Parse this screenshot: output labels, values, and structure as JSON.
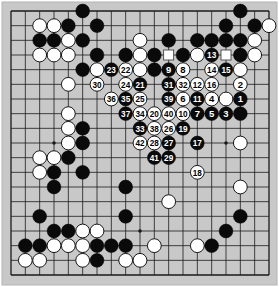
{
  "board": {
    "size": 19,
    "colors": {
      "background": "#c8c8c8",
      "line": "#1a1a1a",
      "black": "#0a0a0a",
      "white": "#ffffff",
      "border": "#b4b4b4"
    },
    "star_points": [
      [
        3,
        3
      ],
      [
        9,
        3
      ],
      [
        15,
        3
      ],
      [
        3,
        9
      ],
      [
        9,
        9
      ],
      [
        15,
        9
      ],
      [
        3,
        15
      ],
      [
        9,
        15
      ],
      [
        15,
        15
      ]
    ],
    "stones": [
      {
        "c": 5,
        "r": 0,
        "color": "B"
      },
      {
        "c": 16,
        "r": 0,
        "color": "B"
      },
      {
        "c": 2,
        "r": 1,
        "color": "W"
      },
      {
        "c": 3,
        "r": 1,
        "color": "W"
      },
      {
        "c": 4,
        "r": 1,
        "color": "B"
      },
      {
        "c": 6,
        "r": 1,
        "color": "B"
      },
      {
        "c": 15,
        "r": 1,
        "color": "B"
      },
      {
        "c": 17,
        "r": 1,
        "color": "B"
      },
      {
        "c": 18,
        "r": 1,
        "color": "W"
      },
      {
        "c": 2,
        "r": 2,
        "color": "B"
      },
      {
        "c": 3,
        "r": 2,
        "color": "B"
      },
      {
        "c": 4,
        "r": 2,
        "color": "W"
      },
      {
        "c": 5,
        "r": 2,
        "color": "B"
      },
      {
        "c": 9,
        "r": 2,
        "color": "W"
      },
      {
        "c": 11,
        "r": 2,
        "color": "B"
      },
      {
        "c": 13,
        "r": 2,
        "color": "B"
      },
      {
        "c": 14,
        "r": 2,
        "color": "B"
      },
      {
        "c": 15,
        "r": 2,
        "color": "B"
      },
      {
        "c": 16,
        "r": 2,
        "color": "B"
      },
      {
        "c": 17,
        "r": 2,
        "color": "W"
      },
      {
        "c": 2,
        "r": 3,
        "color": "W"
      },
      {
        "c": 3,
        "r": 3,
        "color": "W"
      },
      {
        "c": 4,
        "r": 3,
        "color": "W"
      },
      {
        "c": 6,
        "r": 3,
        "color": "B"
      },
      {
        "c": 8,
        "r": 3,
        "color": "B"
      },
      {
        "c": 9,
        "r": 3,
        "color": "W"
      },
      {
        "c": 10,
        "r": 3,
        "color": "B"
      },
      {
        "c": 12,
        "r": 3,
        "color": "B"
      },
      {
        "c": 13,
        "r": 3,
        "color": "W"
      },
      {
        "c": 14,
        "r": 3,
        "color": "B",
        "label": "13"
      },
      {
        "c": 16,
        "r": 3,
        "color": "B"
      },
      {
        "c": 17,
        "r": 3,
        "color": "W"
      },
      {
        "c": 5,
        "r": 4,
        "color": "B"
      },
      {
        "c": 6,
        "r": 4,
        "color": "W"
      },
      {
        "c": 7,
        "r": 4,
        "color": "B",
        "label": "23"
      },
      {
        "c": 8,
        "r": 4,
        "color": "W",
        "label": "22"
      },
      {
        "c": 9,
        "r": 4,
        "color": "W"
      },
      {
        "c": 10,
        "r": 4,
        "color": "B"
      },
      {
        "c": 11,
        "r": 4,
        "color": "B",
        "label": "9"
      },
      {
        "c": 12,
        "r": 4,
        "color": "W",
        "label": "8"
      },
      {
        "c": 14,
        "r": 4,
        "color": "W",
        "label": "14"
      },
      {
        "c": 15,
        "r": 4,
        "color": "B",
        "label": "15"
      },
      {
        "c": 16,
        "r": 4,
        "color": "W"
      },
      {
        "c": 4,
        "r": 5,
        "color": "W"
      },
      {
        "c": 6,
        "r": 5,
        "color": "W",
        "label": "30"
      },
      {
        "c": 8,
        "r": 5,
        "color": "W",
        "label": "24"
      },
      {
        "c": 9,
        "r": 5,
        "color": "B",
        "label": "21"
      },
      {
        "c": 11,
        "r": 5,
        "color": "B",
        "label": "31"
      },
      {
        "c": 12,
        "r": 5,
        "color": "W",
        "label": "32"
      },
      {
        "c": 13,
        "r": 5,
        "color": "W",
        "label": "12"
      },
      {
        "c": 14,
        "r": 5,
        "color": "W",
        "label": "16"
      },
      {
        "c": 16,
        "r": 5,
        "color": "W",
        "label": "2"
      },
      {
        "c": 7,
        "r": 6,
        "color": "W",
        "label": "36"
      },
      {
        "c": 8,
        "r": 6,
        "color": "B",
        "label": "35"
      },
      {
        "c": 9,
        "r": 6,
        "color": "W",
        "label": "25"
      },
      {
        "c": 11,
        "r": 6,
        "color": "B",
        "label": "39"
      },
      {
        "c": 12,
        "r": 6,
        "color": "W",
        "label": "6"
      },
      {
        "c": 13,
        "r": 6,
        "color": "B",
        "label": "11"
      },
      {
        "c": 14,
        "r": 6,
        "color": "W",
        "label": "4"
      },
      {
        "c": 15,
        "r": 6,
        "color": "W"
      },
      {
        "c": 16,
        "r": 6,
        "color": "B",
        "label": "1"
      },
      {
        "c": 4,
        "r": 7,
        "color": "W"
      },
      {
        "c": 8,
        "r": 7,
        "color": "B",
        "label": "37"
      },
      {
        "c": 9,
        "r": 7,
        "color": "W",
        "label": "34"
      },
      {
        "c": 10,
        "r": 7,
        "color": "W",
        "label": "20"
      },
      {
        "c": 11,
        "r": 7,
        "color": "W",
        "label": "40"
      },
      {
        "c": 12,
        "r": 7,
        "color": "W",
        "label": "10"
      },
      {
        "c": 13,
        "r": 7,
        "color": "B",
        "label": "7"
      },
      {
        "c": 14,
        "r": 7,
        "color": "B",
        "label": "5"
      },
      {
        "c": 15,
        "r": 7,
        "color": "B",
        "label": "3"
      },
      {
        "c": 16,
        "r": 7,
        "color": "B"
      },
      {
        "c": 4,
        "r": 8,
        "color": "W"
      },
      {
        "c": 5,
        "r": 8,
        "color": "B"
      },
      {
        "c": 9,
        "r": 8,
        "color": "B",
        "label": "33"
      },
      {
        "c": 10,
        "r": 8,
        "color": "W",
        "label": "38"
      },
      {
        "c": 11,
        "r": 8,
        "color": "W",
        "label": "26"
      },
      {
        "c": 12,
        "r": 8,
        "color": "B",
        "label": "19"
      },
      {
        "c": 4,
        "r": 9,
        "color": "W"
      },
      {
        "c": 5,
        "r": 9,
        "color": "B"
      },
      {
        "c": 9,
        "r": 9,
        "color": "W",
        "label": "42"
      },
      {
        "c": 10,
        "r": 9,
        "color": "W",
        "label": "28"
      },
      {
        "c": 11,
        "r": 9,
        "color": "B",
        "label": "27"
      },
      {
        "c": 13,
        "r": 9,
        "color": "B",
        "label": "17"
      },
      {
        "c": 16,
        "r": 9,
        "color": "W"
      },
      {
        "c": 2,
        "r": 10,
        "color": "W"
      },
      {
        "c": 3,
        "r": 10,
        "color": "W"
      },
      {
        "c": 4,
        "r": 10,
        "color": "B"
      },
      {
        "c": 10,
        "r": 10,
        "color": "B",
        "label": "41"
      },
      {
        "c": 11,
        "r": 10,
        "color": "B",
        "label": "29"
      },
      {
        "c": 2,
        "r": 11,
        "color": "W"
      },
      {
        "c": 3,
        "r": 11,
        "color": "B"
      },
      {
        "c": 5,
        "r": 11,
        "color": "B"
      },
      {
        "c": 13,
        "r": 11,
        "color": "W",
        "label": "18"
      },
      {
        "c": 3,
        "r": 12,
        "color": "B"
      },
      {
        "c": 8,
        "r": 12,
        "color": "B"
      },
      {
        "c": 16,
        "r": 12,
        "color": "W"
      },
      {
        "c": 11,
        "r": 13,
        "color": "W"
      },
      {
        "c": 2,
        "r": 14,
        "color": "B"
      },
      {
        "c": 8,
        "r": 14,
        "color": "B"
      },
      {
        "c": 16,
        "r": 14,
        "color": "B"
      },
      {
        "c": 3,
        "r": 15,
        "color": "B"
      },
      {
        "c": 4,
        "r": 15,
        "color": "B"
      },
      {
        "c": 5,
        "r": 15,
        "color": "W"
      },
      {
        "c": 6,
        "r": 15,
        "color": "W"
      },
      {
        "c": 15,
        "r": 15,
        "color": "B"
      },
      {
        "c": 1,
        "r": 16,
        "color": "B"
      },
      {
        "c": 2,
        "r": 16,
        "color": "B"
      },
      {
        "c": 3,
        "r": 16,
        "color": "W"
      },
      {
        "c": 4,
        "r": 16,
        "color": "W"
      },
      {
        "c": 5,
        "r": 16,
        "color": "W"
      },
      {
        "c": 6,
        "r": 16,
        "color": "B"
      },
      {
        "c": 7,
        "r": 16,
        "color": "B"
      },
      {
        "c": 8,
        "r": 16,
        "color": "B"
      },
      {
        "c": 10,
        "r": 16,
        "color": "W"
      },
      {
        "c": 13,
        "r": 16,
        "color": "W"
      },
      {
        "c": 14,
        "r": 16,
        "color": "B"
      },
      {
        "c": 1,
        "r": 17,
        "color": "W"
      },
      {
        "c": 2,
        "r": 17,
        "color": "W"
      },
      {
        "c": 5,
        "r": 17,
        "color": "W"
      },
      {
        "c": 6,
        "r": 17,
        "color": "B"
      },
      {
        "c": 8,
        "r": 17,
        "color": "W"
      },
      {
        "c": 9,
        "r": 17,
        "color": "W"
      }
    ],
    "markers": [
      {
        "c": 11,
        "r": 3,
        "shape": "square"
      },
      {
        "c": 15,
        "r": 3,
        "shape": "square"
      }
    ]
  }
}
